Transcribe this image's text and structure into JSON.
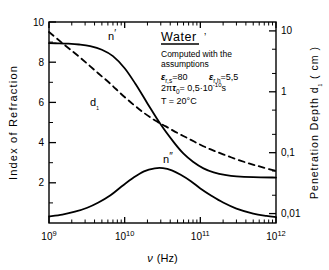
{
  "chart_data": {
    "type": "line",
    "title": "",
    "xlabel": "ν (Hz)",
    "ylabel": "Index of Refraction",
    "y2label": "Penetration Depth d₁ (cm)",
    "xscale": "log",
    "xlim": [
      1000000000.0,
      1000000000000.0
    ],
    "ylim": [
      0,
      10
    ],
    "y2scale": "log",
    "y2lim": [
      0.007,
      14
    ],
    "grid": false,
    "legend": "none (inline curve labels)",
    "xticks": [
      "10⁹",
      "10¹⁰",
      "10¹¹",
      "10¹²"
    ],
    "xtick_values": [
      1000000000.0,
      10000000000.0,
      100000000000.0,
      1000000000000.0
    ],
    "yticks": [
      "2",
      "4",
      "6",
      "8",
      "10"
    ],
    "ytick_values": [
      2,
      4,
      6,
      8,
      10
    ],
    "y2ticks": [
      "10",
      "1",
      "0,1",
      "0,01"
    ],
    "y2tick_values": [
      10,
      1,
      0.1,
      0.01
    ],
    "series": [
      {
        "name": "n'",
        "style": "solid",
        "axis": "left",
        "label": "n'",
        "points": [
          [
            1000000000.0,
            8.95
          ],
          [
            1300000000.0,
            8.94
          ],
          [
            1800000000.0,
            8.92
          ],
          [
            2500000000.0,
            8.88
          ],
          [
            3500000000.0,
            8.8
          ],
          [
            5000000000.0,
            8.62
          ],
          [
            7000000000.0,
            8.3
          ],
          [
            10000000000.0,
            7.7
          ],
          [
            14000000000.0,
            6.9
          ],
          [
            20000000000.0,
            5.95
          ],
          [
            30000000000.0,
            4.9
          ],
          [
            45000000000.0,
            4.0
          ],
          [
            60000000000.0,
            3.45
          ],
          [
            80000000000.0,
            3.05
          ],
          [
            110000000000.0,
            2.72
          ],
          [
            150000000000.0,
            2.52
          ],
          [
            220000000000.0,
            2.38
          ],
          [
            300000000000.0,
            2.32
          ],
          [
            500000000000.0,
            2.28
          ],
          [
            1000000000000.0,
            2.26
          ]
        ]
      },
      {
        "name": "n''",
        "style": "solid",
        "axis": "left",
        "label": "n''",
        "points": [
          [
            1000000000.0,
            0.33
          ],
          [
            1500000000.0,
            0.42
          ],
          [
            2200000000.0,
            0.56
          ],
          [
            3200000000.0,
            0.76
          ],
          [
            4500000000.0,
            1.02
          ],
          [
            6500000000.0,
            1.38
          ],
          [
            9000000000.0,
            1.8
          ],
          [
            13000000000.0,
            2.25
          ],
          [
            18000000000.0,
            2.57
          ],
          [
            25000000000.0,
            2.72
          ],
          [
            32000000000.0,
            2.73
          ],
          [
            42000000000.0,
            2.62
          ],
          [
            55000000000.0,
            2.4
          ],
          [
            75000000000.0,
            2.08
          ],
          [
            100000000000.0,
            1.72
          ],
          [
            140000000000.0,
            1.36
          ],
          [
            200000000000.0,
            1.02
          ],
          [
            300000000000.0,
            0.72
          ],
          [
            500000000000.0,
            0.47
          ],
          [
            750000000000.0,
            0.35
          ],
          [
            1000000000000.0,
            0.29
          ]
        ]
      },
      {
        "name": "d₁",
        "style": "dashed",
        "axis": "right",
        "label": "d₁",
        "points": [
          [
            1000000000.0,
            9.6
          ],
          [
            1500000000.0,
            6.3
          ],
          [
            2200000000.0,
            4.3
          ],
          [
            3200000000.0,
            2.9
          ],
          [
            4500000000.0,
            2.0
          ],
          [
            6500000000.0,
            1.35
          ],
          [
            9000000000.0,
            0.92
          ],
          [
            13000000000.0,
            0.62
          ],
          [
            18000000000.0,
            0.45
          ],
          [
            25000000000.0,
            0.34
          ],
          [
            35000000000.0,
            0.27
          ],
          [
            50000000000.0,
            0.21
          ],
          [
            70000000000.0,
            0.17
          ],
          [
            100000000000.0,
            0.135
          ],
          [
            140000000000.0,
            0.112
          ],
          [
            200000000000.0,
            0.094
          ],
          [
            300000000000.0,
            0.078
          ],
          [
            450000000000.0,
            0.066
          ],
          [
            650000000000.0,
            0.058
          ],
          [
            1000000000000.0,
            0.05
          ]
        ]
      }
    ],
    "annotation": {
      "heading": "Water",
      "heading_mark": "’",
      "line1": "Computed with the",
      "line2": "assumptions",
      "eps_s_symbol": "ε",
      "eps_s_sub": "r,s",
      "eps_s_eq": "=80",
      "eps_h_symbol": "ε",
      "eps_h_sub": "r,h",
      "eps_h_eq": "=5,5",
      "tau_pre": "2π",
      "tau_symbol": "τ",
      "tau_sub": "0",
      "tau_eq": "= 0,5·10",
      "tau_exp": "-10",
      "tau_unit": "s",
      "temperature": "T = 20°C"
    }
  },
  "axes": {
    "left_label_parts": [
      "Index",
      "of",
      "Refraction"
    ],
    "right_label_parts": [
      "Penetration",
      "Depth",
      "d₁",
      "( cm )"
    ],
    "x_label_symbol": "ν",
    "x_label_unit": "(Hz)"
  },
  "colors": {
    "ink": "#000000",
    "background": "#ffffff"
  }
}
